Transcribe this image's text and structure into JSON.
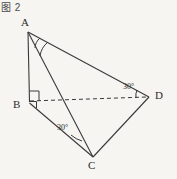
{
  "figure": {
    "caption": "图 2",
    "type": "solid-geometry-diagram",
    "shape": "tetrahedron",
    "stroke_color": "#3a3a3a",
    "background_color": "#f6f5f2",
    "label_color": "#2b2b2b"
  },
  "vertices": [
    {
      "name": "A",
      "label": "A",
      "x": 28,
      "y": 32
    },
    {
      "name": "B",
      "label": "B",
      "x": 29,
      "y": 101
    },
    {
      "name": "C",
      "label": "C",
      "x": 93,
      "y": 157
    },
    {
      "name": "D",
      "label": "D",
      "x": 149,
      "y": 97
    }
  ],
  "edges": [
    {
      "name": "AB",
      "from": "A",
      "to": "B",
      "style": "solid"
    },
    {
      "name": "AC",
      "from": "A",
      "to": "C",
      "style": "solid"
    },
    {
      "name": "AD",
      "from": "A",
      "to": "D",
      "style": "solid"
    },
    {
      "name": "BC",
      "from": "B",
      "to": "C",
      "style": "solid"
    },
    {
      "name": "CD",
      "from": "C",
      "to": "D",
      "style": "solid"
    },
    {
      "name": "BD",
      "from": "B",
      "to": "D",
      "style": "dashed"
    }
  ],
  "markers": {
    "right_angle_at_B": {
      "label": "",
      "vertex": "B",
      "type": "right-angle-square"
    },
    "right_angle_at_B_lower": {
      "label": "",
      "vertex": "B",
      "type": "right-angle-square"
    },
    "angle_at_A": {
      "label": "",
      "vertex": "A",
      "type": "arc"
    }
  },
  "angle_labels": [
    {
      "name": "angle-at-C",
      "vertex": "C",
      "text": "30°",
      "between": "CB and CA"
    },
    {
      "name": "angle-at-D",
      "vertex": "D",
      "text": "30°",
      "between": "DB and DA"
    }
  ]
}
